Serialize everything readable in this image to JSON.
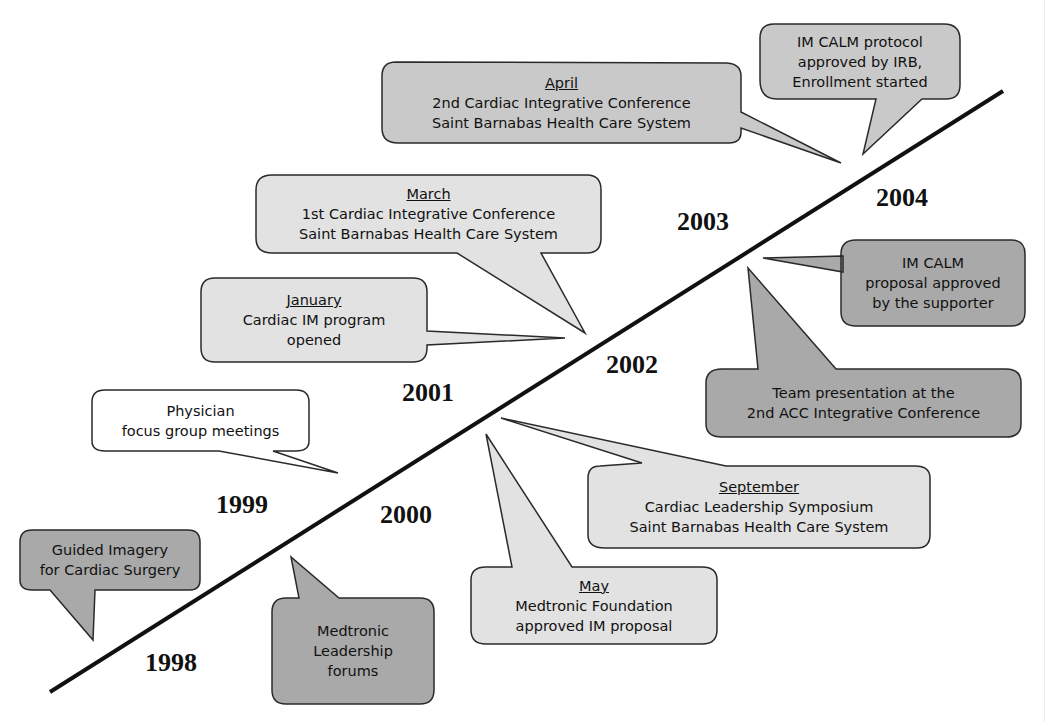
{
  "diagram": {
    "type": "timeline",
    "colors": {
      "line": "#111111",
      "dark_fill": "#a9a9a9",
      "medium_fill": "#c9c9c9",
      "light_fill": "#e2e2e2",
      "white_fill": "#ffffff",
      "stroke": "#2a2a2a"
    },
    "years": [
      "1998",
      "1999",
      "2000",
      "2001",
      "2002",
      "2003",
      "2004"
    ],
    "events": [
      {
        "id": "guided-imagery",
        "year": "1998",
        "month": "",
        "lines": [
          "Guided Imagery",
          "for Cardiac Surgery"
        ]
      },
      {
        "id": "medtronic-leadership",
        "year": "1999",
        "month": "",
        "lines": [
          "Medtronic",
          "Leadership",
          "forums"
        ]
      },
      {
        "id": "physician-focus",
        "year": "1999",
        "month": "",
        "lines": [
          "Physician",
          "focus group meetings"
        ]
      },
      {
        "id": "medtronic-foundation",
        "year": "2001",
        "month": "May",
        "lines": [
          "Medtronic Foundation",
          "approved IM proposal"
        ]
      },
      {
        "id": "leadership-symposium",
        "year": "2001",
        "month": "September",
        "lines": [
          "Cardiac Leadership Symposium",
          "Saint Barnabas Health Care System"
        ]
      },
      {
        "id": "cardiac-im-opened",
        "year": "2002",
        "month": "January",
        "lines": [
          "Cardiac IM program",
          "opened"
        ]
      },
      {
        "id": "first-conference",
        "year": "2002",
        "month": "March",
        "lines": [
          "1st Cardiac Integrative Conference",
          "Saint Barnabas Health Care System"
        ]
      },
      {
        "id": "team-presentation",
        "year": "2003",
        "month": "",
        "lines": [
          "Team presentation at the",
          "2nd ACC Integrative Conference"
        ]
      },
      {
        "id": "im-calm-proposal",
        "year": "2003",
        "month": "",
        "lines": [
          "IM CALM",
          "proposal approved",
          "by the supporter"
        ]
      },
      {
        "id": "second-conference",
        "year": "2003",
        "month": "April",
        "lines": [
          "2nd Cardiac Integrative Conference",
          "Saint Barnabas Health Care System"
        ]
      },
      {
        "id": "im-calm-protocol",
        "year": "2004",
        "month": "",
        "lines": [
          "IM CALM protocol",
          "approved by IRB,",
          "Enrollment started"
        ]
      }
    ]
  }
}
